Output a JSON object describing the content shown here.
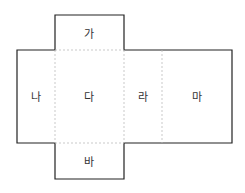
{
  "diagram": {
    "type": "box-net",
    "faces": [
      {
        "id": "ga",
        "label": "가",
        "x": 89,
        "y": 33
      },
      {
        "id": "na",
        "label": "나",
        "x": 36,
        "y": 96
      },
      {
        "id": "da",
        "label": "다",
        "x": 89,
        "y": 96
      },
      {
        "id": "ra",
        "label": "라",
        "x": 143,
        "y": 96
      },
      {
        "id": "ma",
        "label": "마",
        "x": 197,
        "y": 96
      },
      {
        "id": "ba",
        "label": "바",
        "x": 89,
        "y": 161
      }
    ],
    "colors": {
      "outline": "#222222",
      "fold": "#bbbbbb",
      "text": "#333333"
    }
  }
}
